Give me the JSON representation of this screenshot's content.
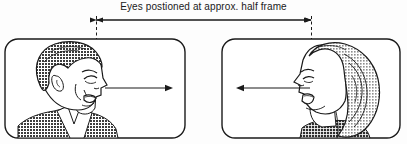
{
  "figure": {
    "caption": "Eyes postioned at approx. half frame",
    "background_color": "#fdfdfd",
    "ink_color": "#1a1a1a"
  },
  "measurement": {
    "name": "half-frame-span",
    "left_marker_x": 96,
    "right_marker_x": 311,
    "rule_y": 20,
    "style": "double-headed-arrow",
    "dashed_guide_top_y": 16,
    "dashed_guide_bottom_y": 75
  },
  "panels": [
    {
      "id": "left-panel",
      "name": "tv-frame-left",
      "subject": "man-profile-facing-right",
      "hair_tone": "#4a4a4a",
      "frame": {
        "x": 5,
        "y": 39,
        "width": 180,
        "height": 99,
        "radius": 13
      },
      "gaze_arrow": {
        "name": "gaze-direction-arrow-right",
        "direction": "right",
        "from_x": 105,
        "to_x": 173,
        "y": 88
      },
      "eye_line_x": 96
    },
    {
      "id": "right-panel",
      "name": "tv-frame-right",
      "subject": "woman-profile-facing-left",
      "hair_tone": "#9a9a9a",
      "frame": {
        "x": 222,
        "y": 39,
        "width": 178,
        "height": 99,
        "radius": 13
      },
      "gaze_arrow": {
        "name": "gaze-direction-arrow-left",
        "direction": "left",
        "from_x": 310,
        "to_x": 236,
        "y": 88
      },
      "eye_line_x": 311
    }
  ]
}
